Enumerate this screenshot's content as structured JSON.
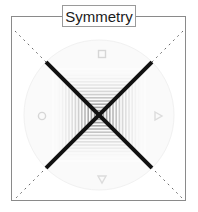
{
  "figure": {
    "title": "Symmetry",
    "width": 198,
    "height": 212,
    "background_color": "#ffffff",
    "frame_color": "#8a8a8a"
  },
  "diagram": {
    "name": "symmetry-diagram",
    "center_x": 99,
    "center_y": 115,
    "disc": {
      "name": "background-disc",
      "radius": 75,
      "fill_color": "#fafafa",
      "stroke_color": "#f0f0f0"
    },
    "nested_squares": {
      "name": "concentric-squares",
      "count": 14,
      "outer_half_size": 46,
      "step": 3.2,
      "shade_from": "#ffffff",
      "shade_to": "#9e9e9e",
      "description": "Concentric square rings forming a graded grayscale pattern radiating from the center"
    },
    "symmetry_axes": [
      {
        "name": "diagonal-axis-nwse",
        "angle_deg": 45,
        "solid_color": "#111111",
        "solid_width": 4,
        "dash_color": "#6b6b6b",
        "dash_width": 1,
        "dash_pattern": "2 4",
        "inner_extent": 75,
        "outer_extent": 118
      },
      {
        "name": "diagonal-axis-nesw",
        "angle_deg": 135,
        "solid_color": "#111111",
        "solid_width": 4,
        "dash_color": "#6b6b6b",
        "dash_width": 1,
        "dash_pattern": "2 4",
        "inner_extent": 75,
        "outer_extent": 118
      }
    ],
    "markers": [
      {
        "name": "marker-top",
        "shape": "square",
        "label": "□",
        "x": 101,
        "y": 54,
        "color": "#d8d8d8"
      },
      {
        "name": "marker-right",
        "shape": "triangle",
        "label": "▶",
        "x": 159,
        "y": 116,
        "color": "#dcdcdc"
      },
      {
        "name": "marker-bottom",
        "shape": "triangle",
        "label": "▼",
        "x": 101,
        "y": 179,
        "color": "#dcdcdc"
      },
      {
        "name": "marker-left",
        "shape": "circle",
        "label": "○",
        "x": 42,
        "y": 116,
        "color": "#d8d8d8"
      }
    ]
  }
}
